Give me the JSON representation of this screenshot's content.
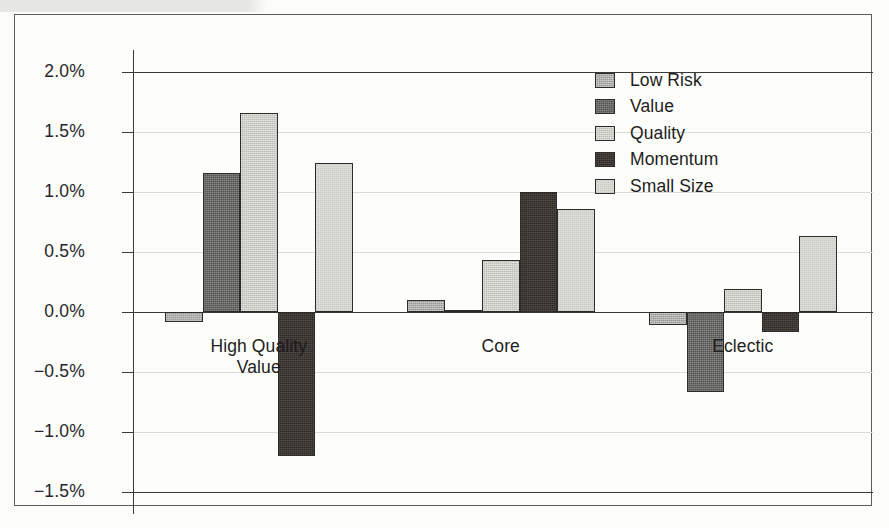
{
  "chart_data": {
    "type": "bar",
    "title": "",
    "subtitle": "",
    "xlabel": "",
    "ylabel": "",
    "categories": [
      "High Quality\nValue",
      "Core",
      "Eclectic"
    ],
    "category_labels_flat": [
      "High Quality Value",
      "Core",
      "Eclectic"
    ],
    "series": [
      {
        "name": "Low Risk",
        "color": "#9a9a95",
        "values": [
          -0.08,
          0.1,
          -0.11
        ]
      },
      {
        "name": "Value",
        "color": "#555551",
        "values": [
          1.16,
          0.02,
          -0.67
        ]
      },
      {
        "name": "Quality",
        "color": "#bdbdb6",
        "values": [
          1.66,
          0.43,
          0.19
        ]
      },
      {
        "name": "Momentum",
        "color": "#2e2824",
        "values": [
          -1.2,
          1.0,
          -0.17
        ]
      },
      {
        "name": "Small Size",
        "color": "#e2e2dc",
        "values": [
          1.24,
          0.86,
          0.63
        ]
      }
    ],
    "y_ticks": [
      2.0,
      1.5,
      1.0,
      0.5,
      0.0,
      -0.5,
      -1.0,
      -1.5
    ],
    "y_tick_labels": [
      "2.0%",
      "1.5%",
      "1.0%",
      "0.5%",
      "0.0%",
      "−0.5%",
      "−1.0%",
      "−1.5%"
    ],
    "ylim": [
      -1.5,
      2.0
    ],
    "value_format": "percent",
    "grid": true,
    "grid_axis": "y",
    "legend_position": "top-right",
    "zero_line": true,
    "axis_color": "#3a3a38",
    "grid_color": "#dcdcd6",
    "bar_border_color": "#2c2c2a",
    "background_color": "#fdfdfb"
  },
  "legend": {
    "items": [
      {
        "label": "Low Risk",
        "swatch_class": "fill-lowrisk"
      },
      {
        "label": "Value",
        "swatch_class": "fill-value"
      },
      {
        "label": "Quality",
        "swatch_class": "fill-quality"
      },
      {
        "label": "Momentum",
        "swatch_class": "fill-momentum"
      },
      {
        "label": "Small Size",
        "swatch_class": "fill-smallsize"
      }
    ]
  }
}
